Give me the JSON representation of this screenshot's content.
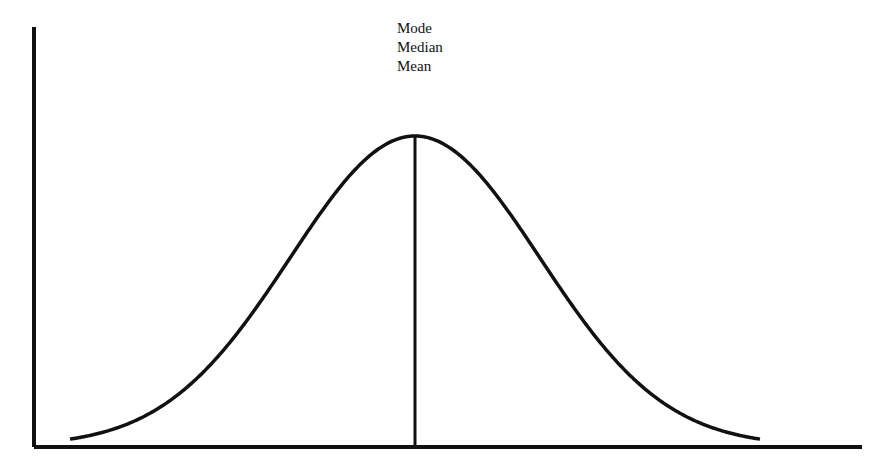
{
  "chart_data": {
    "type": "line",
    "title": "",
    "xlabel": "",
    "ylabel": "",
    "annotations": [
      "Mode",
      "Median",
      "Mean"
    ],
    "series": [
      {
        "name": "normal distribution",
        "x": [
          -2.7,
          -2.0,
          -1.5,
          -1.0,
          -0.5,
          0.0,
          0.5,
          1.0,
          1.5,
          2.0,
          2.7
        ],
        "values": [
          0.026,
          0.135,
          0.325,
          0.607,
          0.882,
          1.0,
          0.882,
          0.607,
          0.325,
          0.135,
          0.026
        ]
      }
    ],
    "center_line": {
      "x": 0.0,
      "label": "Mode / Median / Mean"
    },
    "grid": false,
    "legend": false,
    "axes": {
      "x_ticks": [],
      "y_ticks": []
    }
  },
  "labels": {
    "mode": "Mode",
    "median": "Median",
    "mean": "Mean"
  },
  "colors": {
    "line": "#111111",
    "background": "#ffffff"
  }
}
